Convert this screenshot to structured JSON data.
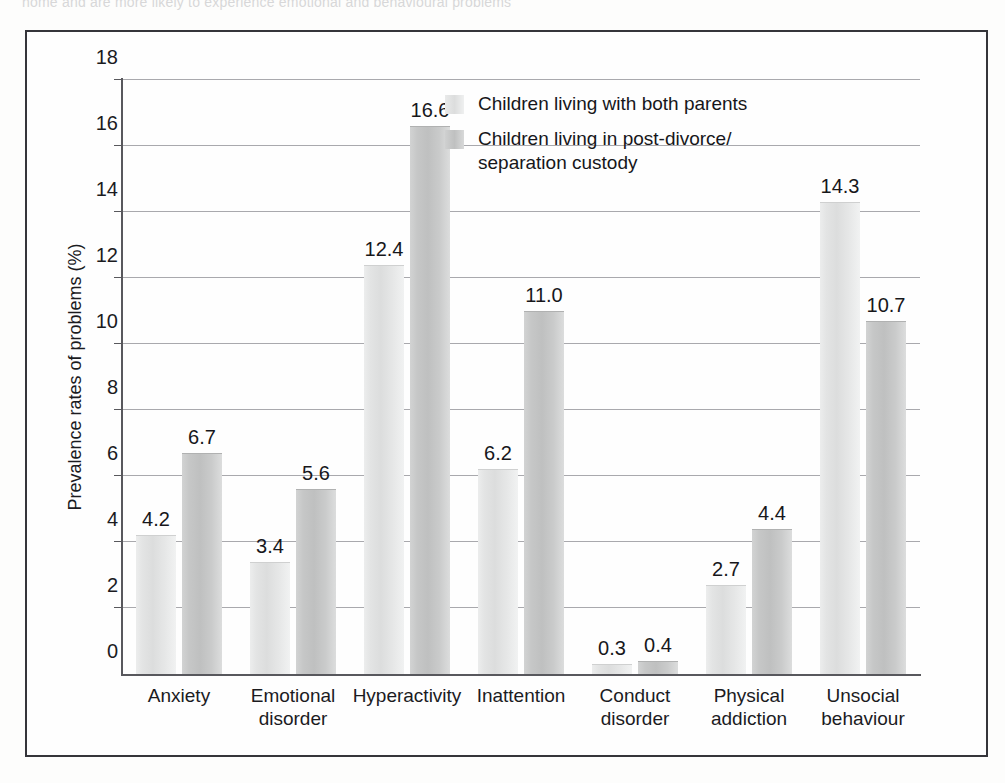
{
  "page": {
    "top_cropped_text": "home and are more likely to experience emotional and behavioural problems"
  },
  "chart_data": {
    "type": "bar",
    "title": "",
    "xlabel": "",
    "ylabel": "Prevalence rates of problems (%)",
    "ylim": [
      0,
      18
    ],
    "ytick_labels": [
      "0",
      "2",
      "4",
      "6",
      "8",
      "10",
      "12",
      "14",
      "16",
      "18"
    ],
    "ytick_values": [
      0,
      2,
      4,
      6,
      8,
      10,
      12,
      14,
      16,
      18
    ],
    "grid": "horizontal",
    "legend_position": "inside-top-center",
    "categories": [
      "Anxiety",
      "Emotional\ndisorder",
      "Hyperactivity",
      "Inattention",
      "Conduct\ndisorder",
      "Physical\naddiction",
      "Unsocial\nbehaviour"
    ],
    "series": [
      {
        "name": "Children living with both parents",
        "color": "#dcdddd",
        "values": [
          4.2,
          3.4,
          12.4,
          6.2,
          0.3,
          2.7,
          14.3
        ],
        "labels": [
          "4.2",
          "3.4",
          "12.4",
          "6.2",
          "0.3",
          "2.7",
          "14.3"
        ]
      },
      {
        "name": "Children living in post-divorce/\nseparation custody",
        "color": "#bfc0c0",
        "values": [
          6.7,
          5.6,
          16.6,
          11.0,
          0.4,
          4.4,
          10.7
        ],
        "labels": [
          "6.7",
          "5.6",
          "16.6",
          "11.0",
          "0.4",
          "4.4",
          "10.7"
        ]
      }
    ]
  }
}
